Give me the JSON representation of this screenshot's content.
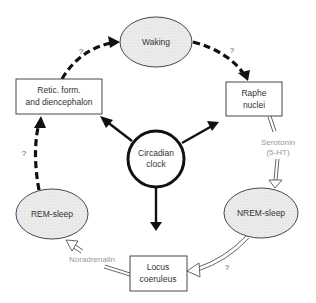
{
  "diagram": {
    "type": "sleep-wake regulation cycle",
    "center": {
      "label_line1": "Circadian",
      "label_line2": "clock"
    },
    "nodes": {
      "waking": {
        "label": "Waking",
        "shape": "ellipse"
      },
      "raphe": {
        "label_line1": "Raphe",
        "label_line2": "nuclei",
        "shape": "box"
      },
      "nrem": {
        "label": "NREM-sleep",
        "shape": "ellipse"
      },
      "locus": {
        "label_line1": "Locus",
        "label_line2": "coeruleus",
        "shape": "box"
      },
      "rem": {
        "label": "REM-sleep",
        "shape": "ellipse"
      },
      "retic": {
        "label_line1": "Retic. form.",
        "label_line2": "and diencephalon",
        "shape": "box"
      }
    },
    "annotations": {
      "serotonin_line1": "Serotonin",
      "serotonin_line2": "(5-HT)",
      "noradrenalin": "Noradrenalin"
    },
    "uncertain_marks": {
      "retic_to_waking": "?",
      "waking_to_raphe": "?",
      "rem_to_retic": "?",
      "nrem_to_locus": "?"
    },
    "edges": [
      {
        "from": "waking",
        "to": "raphe",
        "style": "dashed",
        "uncertain": true
      },
      {
        "from": "raphe",
        "to": "nrem",
        "style": "double-hollow",
        "label": "Serotonin (5-HT)"
      },
      {
        "from": "nrem",
        "to": "locus",
        "style": "double-hollow",
        "uncertain": true
      },
      {
        "from": "locus",
        "to": "rem",
        "style": "double-hollow",
        "label": "Noradrenalin"
      },
      {
        "from": "rem",
        "to": "retic",
        "style": "dashed",
        "uncertain": true
      },
      {
        "from": "retic",
        "to": "waking",
        "style": "dashed",
        "uncertain": true
      },
      {
        "from": "circadian_clock",
        "to": "retic",
        "style": "solid"
      },
      {
        "from": "circadian_clock",
        "to": "raphe",
        "style": "solid"
      },
      {
        "from": "circadian_clock",
        "to": "locus",
        "style": "solid"
      }
    ],
    "colors": {
      "ellipse_fill": "#e8e8e8",
      "stroke": "#111111",
      "annotation_text": "#999999",
      "hollow_arrow": "#666666"
    }
  }
}
